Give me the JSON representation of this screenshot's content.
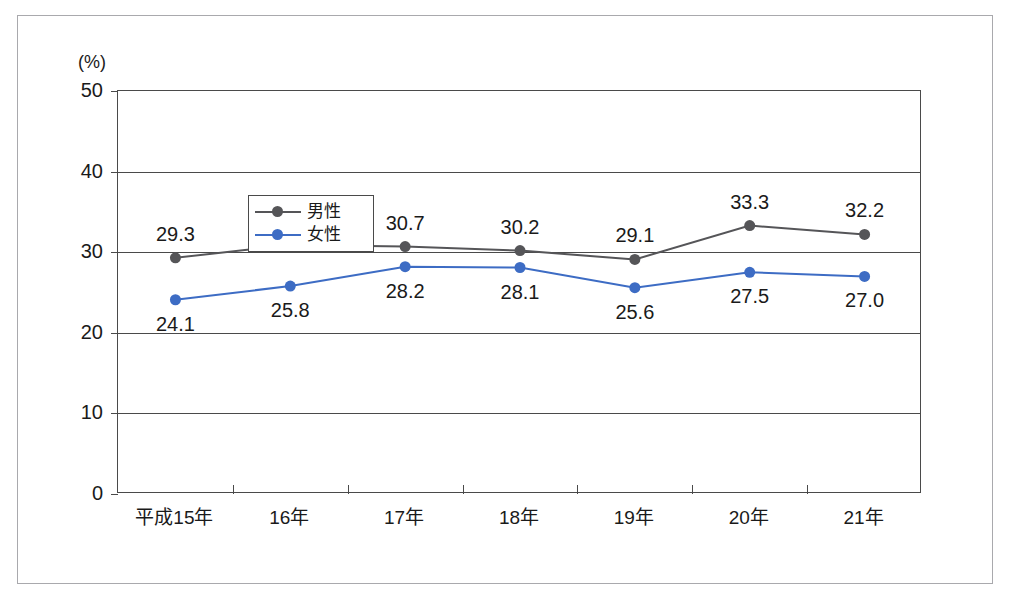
{
  "chart_data": {
    "type": "line",
    "title": "",
    "xlabel": "",
    "ylabel": "(%)",
    "unit_label": "(%)",
    "ylim": [
      0,
      50
    ],
    "ytick_values": [
      50,
      40,
      30,
      20,
      10,
      0
    ],
    "ytick_labels": [
      "50",
      "40",
      "30",
      "20",
      "10",
      "0"
    ],
    "grid": true,
    "legend_position": "top-left inside plot",
    "categories": [
      "平成15年",
      "16年",
      "17年",
      "18年",
      "19年",
      "20年",
      "21年"
    ],
    "series": [
      {
        "name": "男性",
        "color": "#555558",
        "label_position": "above",
        "values": [
          29.3,
          30.9,
          30.7,
          30.2,
          29.1,
          33.3,
          32.2
        ],
        "value_labels": [
          "29.3",
          "30.9",
          "30.7",
          "30.2",
          "29.1",
          "33.3",
          "32.2"
        ]
      },
      {
        "name": "女性",
        "color": "#3d6cc4",
        "label_position": "below",
        "values": [
          24.1,
          25.8,
          28.2,
          28.1,
          25.6,
          27.5,
          27.0
        ],
        "value_labels": [
          "24.1",
          "25.8",
          "28.2",
          "28.1",
          "25.6",
          "27.5",
          "27.0"
        ]
      }
    ]
  },
  "legend": {
    "items": [
      {
        "label": "男性",
        "color": "#555558"
      },
      {
        "label": "女性",
        "color": "#3d6cc4"
      }
    ]
  },
  "colors": {
    "male": "#555558",
    "female": "#3d6cc4",
    "axis": "#4a4a4a",
    "frame": "#a9a9ad",
    "text": "#1a1a1a",
    "background": "#ffffff"
  }
}
